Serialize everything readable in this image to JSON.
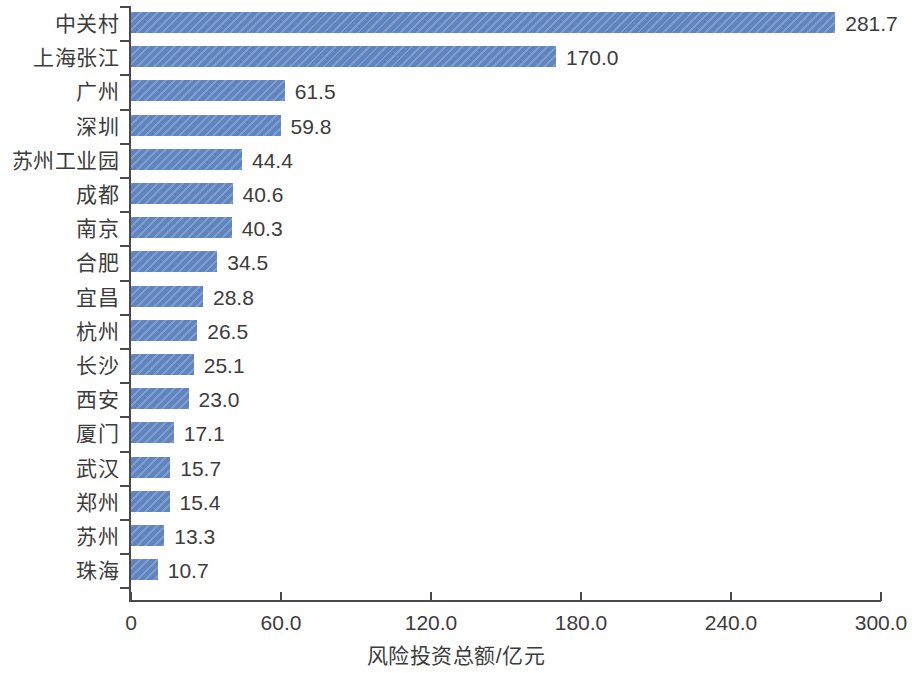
{
  "chart_data": {
    "type": "bar",
    "orientation": "horizontal",
    "title": "",
    "xlabel": "风险投资总额/亿元",
    "ylabel": "",
    "xlim": [
      0,
      300
    ],
    "xticks": [
      0,
      60,
      120,
      180,
      240,
      300
    ],
    "xtick_labels": [
      "0",
      "60.0",
      "120.0",
      "180.0",
      "240.0",
      "300.0"
    ],
    "grid": false,
    "legend": null,
    "bar_color": "#5f84bf",
    "categories": [
      "中关村",
      "上海张江",
      "广州",
      "深圳",
      "苏州工业园",
      "成都",
      "南京",
      "合肥",
      "宜昌",
      "杭州",
      "长沙",
      "西安",
      "厦门",
      "武汉",
      "郑州",
      "苏州",
      "珠海"
    ],
    "values": [
      281.7,
      170.0,
      61.5,
      59.8,
      44.4,
      40.6,
      40.3,
      34.5,
      28.8,
      26.5,
      25.1,
      23.0,
      17.1,
      15.7,
      15.4,
      13.3,
      10.7
    ],
    "value_labels": [
      "281.7",
      "170.0",
      "61.5",
      "59.8",
      "44.4",
      "40.6",
      "40.3",
      "34.5",
      "28.8",
      "26.5",
      "25.1",
      "23.0",
      "17.1",
      "15.7",
      "15.4",
      "13.3",
      "10.7"
    ]
  }
}
